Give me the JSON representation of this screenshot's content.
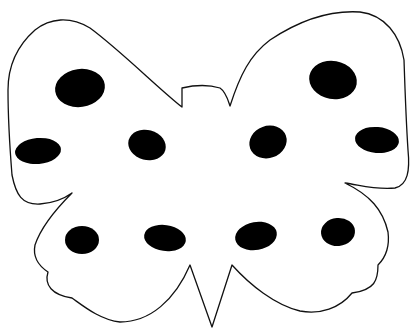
{
  "image": {
    "subject": "butterfly outline coloring page",
    "background_color": "#ffffff",
    "outline_color": "#111111",
    "spot_color": "#000000",
    "spot_count": 10,
    "spots": [
      {
        "id": "upper-left-large",
        "cx": 80,
        "cy": 88,
        "rx": 25,
        "ry": 19
      },
      {
        "id": "upper-right-large",
        "cx": 333,
        "cy": 80,
        "rx": 24,
        "ry": 19
      },
      {
        "id": "mid-left-outer",
        "cx": 38,
        "cy": 151,
        "rx": 23,
        "ry": 13
      },
      {
        "id": "mid-left-inner",
        "cx": 147,
        "cy": 145,
        "rx": 19,
        "ry": 15
      },
      {
        "id": "mid-right-inner",
        "cx": 268,
        "cy": 142,
        "rx": 19,
        "ry": 16
      },
      {
        "id": "mid-right-outer",
        "cx": 377,
        "cy": 140,
        "rx": 22,
        "ry": 13
      },
      {
        "id": "lower-left-outer",
        "cx": 82,
        "cy": 240,
        "rx": 17,
        "ry": 14
      },
      {
        "id": "lower-left-inner",
        "cx": 165,
        "cy": 238,
        "rx": 21,
        "ry": 13
      },
      {
        "id": "lower-right-inner",
        "cx": 256,
        "cy": 236,
        "rx": 21,
        "ry": 14
      },
      {
        "id": "lower-right-outer",
        "cx": 338,
        "cy": 232,
        "rx": 17,
        "ry": 14
      }
    ]
  }
}
